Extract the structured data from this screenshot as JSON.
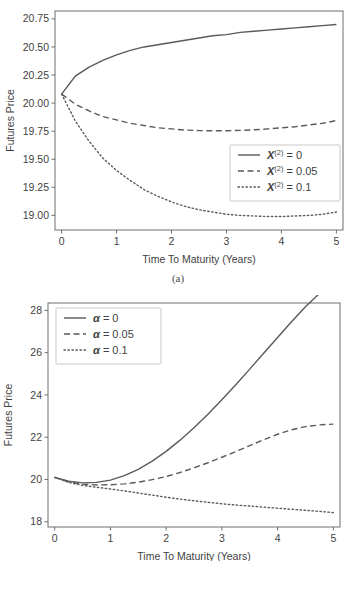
{
  "figures": [
    {
      "id": "a",
      "caption": "(a)",
      "chart_data": {
        "type": "line",
        "title": "",
        "xlabel": "Time To Maturity (Years)",
        "ylabel": "Futures Price",
        "xlim": [
          -0.12,
          5.12
        ],
        "ylim": [
          18.87,
          20.82
        ],
        "xticks": [
          "0",
          "1",
          "2",
          "3",
          "4",
          "5"
        ],
        "xtick_values": [
          0,
          1,
          2,
          3,
          4,
          5
        ],
        "yticks": [
          "19.00",
          "19.25",
          "19.50",
          "19.75",
          "20.00",
          "20.25",
          "20.50",
          "20.75"
        ],
        "ytick_values": [
          19.0,
          19.25,
          19.5,
          19.75,
          20.0,
          20.25,
          20.5,
          20.75
        ],
        "grid": false,
        "legend_position": "center-right",
        "x": [
          0,
          0.25,
          0.5,
          0.75,
          1,
          1.25,
          1.5,
          1.75,
          2,
          2.25,
          2.5,
          2.75,
          3,
          3.25,
          3.5,
          3.75,
          4,
          4.25,
          4.5,
          4.75,
          5
        ],
        "series": [
          {
            "name": "X(2) = 0",
            "label_base": "X",
            "label_sup": "(2)",
            "label_value": "= 0",
            "style": "solid",
            "values": [
              20.08,
              20.24,
              20.32,
              20.38,
              20.43,
              20.47,
              20.5,
              20.52,
              20.54,
              20.56,
              20.58,
              20.6,
              20.61,
              20.63,
              20.64,
              20.65,
              20.66,
              20.67,
              20.68,
              20.69,
              20.7
            ]
          },
          {
            "name": "X(2) = 0.05",
            "label_base": "X",
            "label_sup": "(2)",
            "label_value": "= 0.05",
            "style": "dashed",
            "values": [
              20.08,
              19.99,
              19.93,
              19.88,
              19.85,
              19.82,
              19.8,
              19.78,
              19.77,
              19.76,
              19.755,
              19.753,
              19.754,
              19.757,
              19.762,
              19.77,
              19.78,
              19.79,
              19.805,
              19.82,
              19.845
            ]
          },
          {
            "name": "X(2) = 0.1",
            "label_base": "X",
            "label_sup": "(2)",
            "label_value": "= 0.1",
            "style": "dotted",
            "values": [
              20.08,
              19.84,
              19.66,
              19.51,
              19.4,
              19.31,
              19.23,
              19.17,
              19.12,
              19.08,
              19.05,
              19.03,
              19.01,
              19.0,
              18.995,
              18.99,
              18.99,
              18.995,
              19.0,
              19.01,
              19.03
            ]
          }
        ]
      }
    },
    {
      "id": "b",
      "caption": "(a)",
      "chart_data": {
        "type": "line",
        "title": "",
        "xlabel": "Time To Maturity (Years)",
        "ylabel": "Futures Price",
        "xlim": [
          -0.12,
          5.12
        ],
        "ylim": [
          17.75,
          28.35
        ],
        "xticks": [
          "0",
          "1",
          "2",
          "3",
          "4",
          "5"
        ],
        "xtick_values": [
          0,
          1,
          2,
          3,
          4,
          5
        ],
        "yticks": [
          "18",
          "20",
          "22",
          "24",
          "26",
          "28"
        ],
        "ytick_values": [
          18,
          20,
          22,
          24,
          26,
          28
        ],
        "grid": false,
        "legend_position": "upper-left",
        "x": [
          0,
          0.25,
          0.5,
          0.75,
          1,
          1.25,
          1.5,
          1.75,
          2,
          2.25,
          2.5,
          2.75,
          3,
          3.25,
          3.5,
          3.75,
          4,
          4.25,
          4.5,
          4.75,
          5
        ],
        "series": [
          {
            "name": "alpha = 0",
            "label_base": "α",
            "label_sup": "",
            "label_value": "= 0",
            "style": "solid",
            "values": [
              20.1,
              19.92,
              19.84,
              19.86,
              19.97,
              20.18,
              20.48,
              20.87,
              21.33,
              21.86,
              22.45,
              23.09,
              23.77,
              24.48,
              25.22,
              25.97,
              26.72,
              27.46,
              28.17,
              28.8,
              29.4
            ]
          },
          {
            "name": "alpha = 0.05",
            "label_base": "α",
            "label_sup": "",
            "label_value": "= 0.05",
            "style": "dashed",
            "values": [
              20.1,
              19.89,
              19.78,
              19.74,
              19.75,
              19.79,
              19.87,
              19.99,
              20.14,
              20.33,
              20.55,
              20.79,
              21.05,
              21.32,
              21.6,
              21.88,
              22.14,
              22.35,
              22.5,
              22.58,
              22.62
            ]
          },
          {
            "name": "alpha = 0.1",
            "label_base": "α",
            "label_sup": "",
            "label_value": "= 0.1",
            "style": "dotted",
            "values": [
              20.1,
              19.86,
              19.72,
              19.63,
              19.55,
              19.46,
              19.36,
              19.26,
              19.16,
              19.07,
              18.99,
              18.92,
              18.85,
              18.79,
              18.74,
              18.69,
              18.64,
              18.59,
              18.54,
              18.49,
              18.43
            ]
          }
        ]
      }
    }
  ],
  "colors": {
    "line": "#5a5a5a",
    "frame": "#6e6e6e",
    "text": "#3f3f3f",
    "legend_border": "#c9c9c9",
    "background": "#ffffff"
  }
}
